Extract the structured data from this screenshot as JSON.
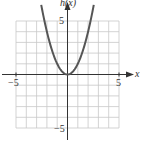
{
  "chart_data": {
    "type": "line",
    "title": "",
    "function": "h(x) = x^2",
    "xlabel": "x",
    "ylabel": "h(x)",
    "xlim": [
      -5,
      5
    ],
    "ylim": [
      -5,
      5
    ],
    "grid": true,
    "x_tick_labels": [
      "-5",
      "5"
    ],
    "y_tick_labels": [
      "5",
      "-5"
    ],
    "series": [
      {
        "name": "h(x)",
        "x": [
          -2.5,
          -2,
          -1.5,
          -1,
          -0.5,
          0,
          0.5,
          1,
          1.5,
          2,
          2.5
        ],
        "y": [
          6.25,
          4,
          2.25,
          1,
          0.25,
          0,
          0.25,
          1,
          2.25,
          4,
          6.25
        ]
      }
    ]
  },
  "labels": {
    "y_axis": "h(x)",
    "x_axis": "x",
    "x_min": "−5",
    "x_max": "5",
    "y_max": "5",
    "y_min": "−5"
  },
  "colors": {
    "grid": "#c8c8c8",
    "axis": "#333333",
    "curve": "#555555"
  }
}
